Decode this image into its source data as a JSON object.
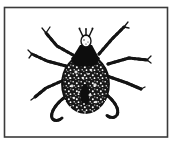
{
  "figure": {
    "style": "woodcut line engraving",
    "colors": {
      "frame": "#3a3a3a",
      "ink": "#141414",
      "background": "#ffffff"
    }
  }
}
